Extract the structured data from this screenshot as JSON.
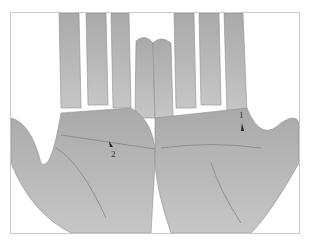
{
  "image": {
    "description": "Grayscale photograph of two open palms side by side with numbered annotation arrows",
    "background_color": "#ffffff",
    "skin_tone": "#b9b9b9",
    "line_tone": "#8a8a8a"
  },
  "annotations": [
    {
      "label": "1",
      "hand": "right"
    },
    {
      "label": "2",
      "hand": "left"
    }
  ]
}
